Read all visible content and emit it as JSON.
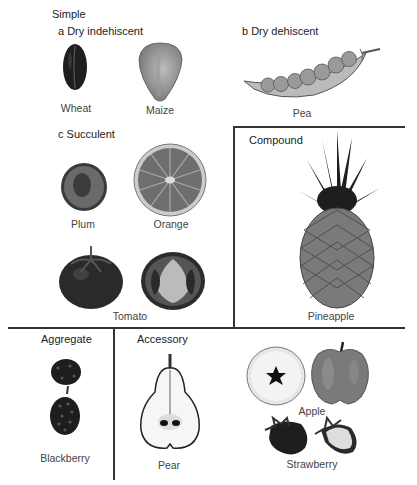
{
  "diagram": {
    "sections": {
      "simple": {
        "title": "Simple",
        "subsections": {
          "dry_indehiscent": {
            "label": "a Dry indehiscent",
            "items": [
              "Wheat",
              "Maize"
            ]
          },
          "dry_dehiscent": {
            "label": "b Dry dehiscent",
            "items": [
              "Pea"
            ]
          },
          "succulent": {
            "label": "c Succulent",
            "items": [
              "Plum",
              "Orange",
              "Tomato"
            ]
          }
        }
      },
      "compound": {
        "title": "Compound",
        "items": [
          "Pineapple"
        ]
      },
      "aggregate": {
        "title": "Aggregate",
        "items": [
          "Blackberry"
        ]
      },
      "accessory": {
        "title": "Accessory",
        "items": [
          "Pear",
          "Apple",
          "Strawberry"
        ]
      }
    }
  }
}
